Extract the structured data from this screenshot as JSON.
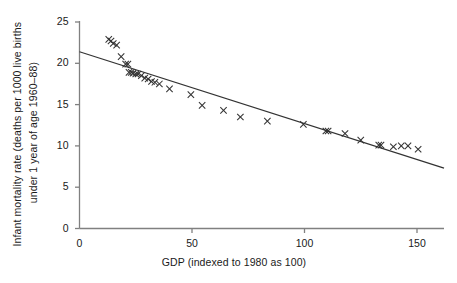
{
  "chart_data": {
    "type": "scatter",
    "title": "",
    "subtitle": "",
    "xlabel": "GDP (indexed to 1980 as 100)",
    "ylabel_line1": "Infant mortality rate (deaths per 1000 live births",
    "ylabel_line2": "under 1 year of age 1960–88)",
    "xlim": [
      0,
      162
    ],
    "ylim": [
      0,
      25
    ],
    "xticks": [
      0,
      50,
      100,
      150
    ],
    "xtick_labels": [
      "0",
      "50",
      "100",
      "150"
    ],
    "yticks": [
      0,
      5,
      10,
      15,
      20,
      25
    ],
    "ytick_labels": [
      "0",
      "5",
      "10",
      "15",
      "20",
      "25"
    ],
    "grid": false,
    "legend": "none",
    "marker": "x",
    "marker_color": "#333333",
    "line_color": "#333333",
    "axis_color": "#808080",
    "series": [
      {
        "name": "Infant mortality vs GDP",
        "type": "scatter",
        "points": [
          [
            13.0,
            22.9
          ],
          [
            14.0,
            22.7
          ],
          [
            15.0,
            22.4
          ],
          [
            16.5,
            22.2
          ],
          [
            18.5,
            20.8
          ],
          [
            20.5,
            19.9
          ],
          [
            21.5,
            19.9
          ],
          [
            22.0,
            18.9
          ],
          [
            23.0,
            18.9
          ],
          [
            23.8,
            18.8
          ],
          [
            25.0,
            18.7
          ],
          [
            26.0,
            18.7
          ],
          [
            27.5,
            18.5
          ],
          [
            29.0,
            18.2
          ],
          [
            30.5,
            18.1
          ],
          [
            32.0,
            17.8
          ],
          [
            33.5,
            17.7
          ],
          [
            35.5,
            17.5
          ],
          [
            40.0,
            16.9
          ],
          [
            49.5,
            16.2
          ],
          [
            54.5,
            14.9
          ],
          [
            64.0,
            14.3
          ],
          [
            71.5,
            13.5
          ],
          [
            83.5,
            13.0
          ],
          [
            99.5,
            12.6
          ],
          [
            109.5,
            11.8
          ],
          [
            110.5,
            11.8
          ],
          [
            118.0,
            11.5
          ],
          [
            125.0,
            10.7
          ],
          [
            133.0,
            10.1
          ],
          [
            134.0,
            10.1
          ],
          [
            139.5,
            9.9
          ],
          [
            143.0,
            10.0
          ],
          [
            146.0,
            10.0
          ],
          [
            150.5,
            9.6
          ]
        ]
      },
      {
        "name": "Fitted regression line",
        "type": "line",
        "endpoints": [
          [
            0,
            21.4
          ],
          [
            162,
            7.3
          ]
        ]
      }
    ]
  }
}
